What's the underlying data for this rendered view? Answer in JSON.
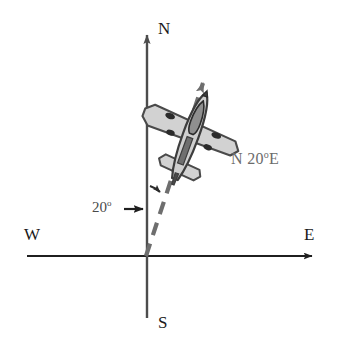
{
  "figure": {
    "width": 338,
    "height": 350,
    "background_color": "#ffffff"
  },
  "axes": {
    "origin": {
      "x": 146,
      "y": 256
    },
    "north": {
      "label": "N",
      "icon": "arrow-up-icon",
      "color": "#4d4d4d",
      "tip": {
        "x": 147,
        "y": 28
      }
    },
    "south": {
      "label": "S",
      "color": "#4d4d4d",
      "end": {
        "x": 147,
        "y": 318
      }
    },
    "west": {
      "label": "W",
      "color": "#1f1f1f",
      "end": {
        "x": 27,
        "y": 256
      }
    },
    "east": {
      "label": "E",
      "icon": "arrow-right-icon",
      "color": "#1f1f1f",
      "tip": {
        "x": 319,
        "y": 256
      }
    }
  },
  "bearing": {
    "label_n": "N",
    "label_degrees": "20",
    "degree_symbol": "o",
    "label_e": "E",
    "full_label": "N 20o E",
    "angle_degrees": 20,
    "color": "#6b6b6b",
    "line_style": "dashed",
    "line_color": "#6e6e6e",
    "icon": "arrow-up-right-icon",
    "start": {
      "x": 146,
      "y": 256
    },
    "tip": {
      "x": 208,
      "y": 74
    }
  },
  "angle_annotation": {
    "label": "20",
    "degree_symbol": "o",
    "full_label": "20o",
    "value": 20,
    "unit": "degrees",
    "color": "#4a4a4a",
    "pointer_icon": "arrow-right-icon",
    "arc_icon": "angle-arc-arrow-icon"
  },
  "airplane": {
    "icon": "airplane-icon",
    "heading_degrees": 20,
    "body_fill": "#d9d9d9",
    "wing_fill": "#d2d2d2",
    "outline_color": "#4a4a4a",
    "detail_color": "#2b2b2b",
    "center": {
      "x": 192,
      "y": 132
    }
  },
  "colors": {
    "axis_dark": "#1f1f1f",
    "axis_gray": "#4d4d4d",
    "dashed_gray": "#6e6e6e",
    "label_gray": "#6b6b6b",
    "plane_light": "#d9d9d9",
    "plane_outline": "#4a4a4a"
  }
}
